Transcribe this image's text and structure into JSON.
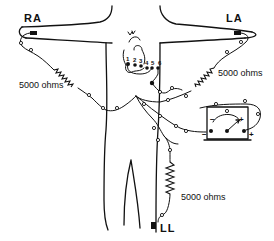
{
  "diagram": {
    "type": "ECG electrode lead placement diagram",
    "leads": {
      "right_arm": "RA",
      "left_arm": "LA",
      "left_leg": "LL"
    },
    "resistors": [
      {
        "id": "ra",
        "label": "5000 ohms"
      },
      {
        "id": "la",
        "label": "5000 ohms"
      },
      {
        "id": "ll",
        "label": "5000 ohms"
      }
    ],
    "chest_positions": [
      "1",
      "2",
      "3",
      "4",
      "5",
      "6"
    ],
    "galvanometer": {
      "zero_label": "0",
      "minus_label": "−",
      "plus_label": "+",
      "terminal_minus": "−",
      "terminal_plus": "+"
    },
    "colors": {
      "ink": "#111111",
      "background": "#ffffff"
    }
  }
}
